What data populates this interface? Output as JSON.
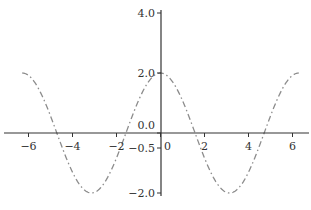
{
  "chart_data": {
    "type": "line",
    "title": "",
    "xlabel": "",
    "ylabel": "",
    "function": "y = 2*cos(x)",
    "xlim": [
      -6.6,
      6.8
    ],
    "ylim": [
      -2.4,
      4.2
    ],
    "grid": false,
    "legend": null,
    "spines": "centered at origin",
    "x_ticks": [
      -6,
      -4,
      -2,
      0,
      2,
      4,
      6
    ],
    "x_tick_labels": [
      "−6",
      "−4",
      "−2",
      "0",
      "2",
      "4",
      "6"
    ],
    "y_ticks": [
      4.0,
      2.0,
      0.0,
      -0.5,
      -2.0
    ],
    "y_tick_labels": [
      "4.0",
      "2.0",
      "0.0",
      "−0.5",
      "−2.0"
    ],
    "series": [
      {
        "name": "2cos(x)",
        "line_style": "dash-dot",
        "color": "#8c8c8c",
        "x": [
          -6.283,
          -5.498,
          -4.712,
          -3.927,
          -3.142,
          -2.356,
          -1.571,
          -0.785,
          0.0,
          0.785,
          1.571,
          2.356,
          3.142,
          3.927,
          4.712,
          5.498,
          6.283
        ],
        "y": [
          2.0,
          1.414,
          0.0,
          -1.414,
          -2.0,
          -1.414,
          0.0,
          1.414,
          2.0,
          1.414,
          0.0,
          -1.414,
          -2.0,
          -1.414,
          0.0,
          1.414,
          2.0
        ]
      }
    ],
    "colors": {
      "axis": "#333333",
      "line": "#8c8c8c"
    }
  }
}
